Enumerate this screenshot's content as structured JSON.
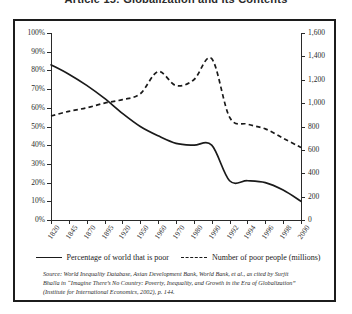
{
  "page": {
    "title": "Article 15: Globalization and Its Contents"
  },
  "legend": {
    "position": "below-axis",
    "items": [
      {
        "label": "Percentage of world that is poor",
        "style": "solid"
      },
      {
        "label": "Number of poor people (millions)",
        "style": "dashed"
      }
    ]
  },
  "source_note": {
    "line1": "Source: World Inequality Database, Asian Development Bank, World Bank, et al., as cited by Surjit",
    "line2": "Bhalla in “Imagine There’s No Country: Poverty, Inequality, and Growth in the Era of Globalization”",
    "line3": "(Institute for International Economics, 2002), p. 144."
  },
  "chart_data": {
    "type": "line",
    "title": "",
    "xlabel": "",
    "grid": false,
    "legend_position": "bottom",
    "x": [
      "1820",
      "1845",
      "1870",
      "1895",
      "1920",
      "1950",
      "1960",
      "1970",
      "1980",
      "1990",
      "1992",
      "1994",
      "1996",
      "1998",
      "2000"
    ],
    "axes": {
      "left": {
        "label": "Percentage of world that is poor",
        "ylim": [
          0,
          100
        ],
        "tick_values": [
          0,
          10,
          20,
          30,
          40,
          50,
          60,
          70,
          80,
          90,
          100
        ],
        "tick_labels": [
          "0%",
          "10%",
          "20%",
          "30%",
          "40%",
          "50%",
          "60%",
          "70%",
          "80%",
          "90%",
          "100%"
        ]
      },
      "right": {
        "label": "Number of poor people (millions)",
        "ylim": [
          0,
          1600
        ],
        "tick_values": [
          0,
          200,
          400,
          600,
          800,
          1000,
          1200,
          1400,
          1600
        ],
        "tick_labels": [
          "0",
          "200",
          "400",
          "600",
          "800",
          "1,000",
          "1,200",
          "1,400",
          "1,600"
        ]
      }
    },
    "series": [
      {
        "name": "Percentage of world that is poor",
        "style": "solid",
        "axis": "left",
        "unit": "%",
        "values": [
          83,
          78,
          72,
          65,
          57,
          50,
          45,
          41,
          40,
          40,
          21,
          21,
          20,
          16,
          10
        ]
      },
      {
        "name": "Number of poor people (millions)",
        "style": "dashed",
        "axis": "right",
        "unit": "millions",
        "values": [
          890,
          930,
          960,
          1000,
          1030,
          1080,
          1270,
          1150,
          1200,
          1380,
          880,
          820,
          780,
          700,
          620
        ]
      }
    ]
  }
}
